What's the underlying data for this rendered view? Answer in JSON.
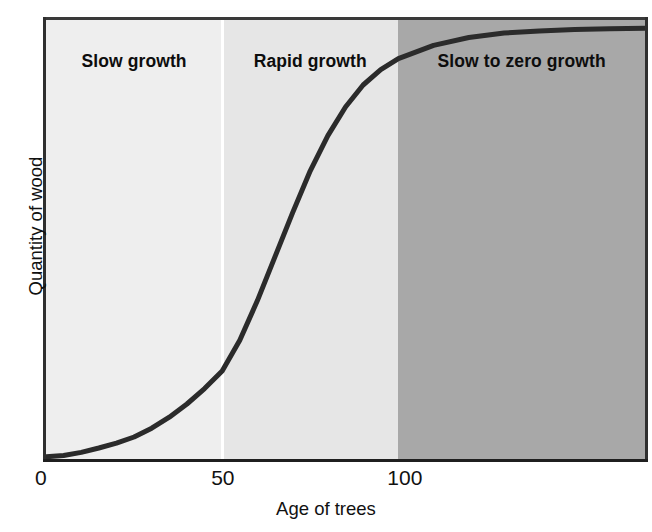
{
  "chart_data": {
    "type": "line",
    "title": "",
    "subtitle": "",
    "xlabel": "Age of trees",
    "ylabel": "Quantity of wood",
    "xlim": [
      0,
      170
    ],
    "ylim": [
      0,
      100
    ],
    "xticks": [
      "0",
      "50",
      "100"
    ],
    "xtick_values": [
      0,
      50,
      100
    ],
    "yticks": [],
    "grid": false,
    "legend": null,
    "series": [
      {
        "name": "Quantity of wood",
        "color": "#2b2b2b",
        "x": [
          0,
          5,
          10,
          15,
          20,
          25,
          30,
          35,
          40,
          45,
          50,
          55,
          60,
          65,
          70,
          75,
          80,
          85,
          90,
          95,
          100,
          110,
          120,
          130,
          140,
          150,
          160,
          170
        ],
        "y": [
          0.5,
          0.8,
          1.5,
          2.5,
          3.6,
          5.0,
          7.0,
          9.5,
          12.5,
          16.0,
          20.0,
          27.0,
          36.0,
          46.0,
          56.0,
          65.5,
          73.5,
          80.0,
          85.0,
          88.5,
          91.0,
          94.0,
          95.8,
          96.8,
          97.3,
          97.6,
          97.8,
          97.9
        ]
      }
    ],
    "bands": [
      {
        "label": "Slow growth",
        "x_start": 0,
        "x_end": 50,
        "fill": "#eeeeee"
      },
      {
        "label": "Rapid growth",
        "x_start": 50,
        "x_end": 100,
        "fill": "#e6e6e6"
      },
      {
        "label": "Slow to zero growth",
        "x_start": 100,
        "x_end": 170,
        "fill": "#a8a8a8"
      }
    ],
    "annotations": [
      "Slow growth",
      "Rapid growth",
      "Slow to zero growth"
    ]
  },
  "axes": {
    "xlabel": "Age of trees",
    "ylabel": "Quantity of wood",
    "xticks": [
      {
        "label": "0"
      },
      {
        "label": "50"
      },
      {
        "label": "100"
      }
    ]
  },
  "bands": [
    {
      "label": "Slow growth"
    },
    {
      "label": "Rapid growth"
    },
    {
      "label": "Slow to zero growth"
    }
  ],
  "colors": {
    "band_slow": "#eeeeee",
    "band_rapid": "#e6e6e6",
    "band_zero": "#a8a8a8",
    "curve": "#2b2b2b",
    "axis": "#1f1f1f",
    "divider": "#ffffff",
    "text": "#111111",
    "background": "#ffffff"
  }
}
